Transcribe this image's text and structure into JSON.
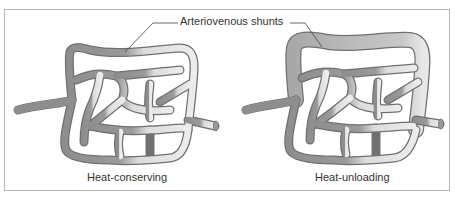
{
  "diagram": {
    "callout_label": "Arteriovenous shunts",
    "panels": [
      {
        "id": "left",
        "caption": "Heat-conserving",
        "shunt_state": "constricted"
      },
      {
        "id": "right",
        "caption": "Heat-unloading",
        "shunt_state": "dilated"
      }
    ],
    "colors": {
      "border": "#b5b5b5",
      "arterial_dark": "#8a8a8a",
      "venous_light": "#e6e6e6",
      "outline": "#6e6e6e",
      "text": "#333333"
    }
  }
}
